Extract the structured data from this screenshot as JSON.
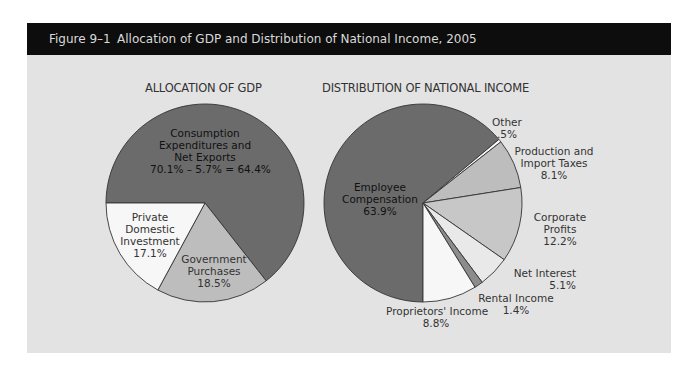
{
  "figure": {
    "number": "Figure 9–1",
    "title": "Allocation of GDP and Distribution of National Income, 2005"
  },
  "colors": {
    "header_bg": "#0d0d0d",
    "header_text": "#d9d9d9",
    "panel_bg": "#e3e3e3",
    "dark_slice": "#6b6b6b",
    "mid_slice": "#bdbdbd",
    "light_slice": "#c7c7c7",
    "pale_slice": "#e9e9e9",
    "white_slice": "#f7f7f7",
    "rental_slice": "#8c8c8c"
  },
  "chart_data": [
    {
      "type": "pie",
      "title": "ALLOCATION OF GDP",
      "categories": [
        "Consumption Expenditures and Net Exports",
        "Government Purchases",
        "Private Domestic Investment"
      ],
      "values": [
        64.4,
        18.5,
        17.1
      ],
      "annotations": [
        "70.1% – 5.7% = 64.4%"
      ],
      "labels": [
        {
          "lines": [
            "Consumption",
            "Expenditures and",
            "Net Exports",
            "70.1% – 5.7% = 64.4%"
          ]
        },
        {
          "lines": [
            "Government",
            "Purchases",
            "18.5%"
          ]
        },
        {
          "lines": [
            "Private",
            "Domestic",
            "Investment",
            "17.1%"
          ]
        }
      ]
    },
    {
      "type": "pie",
      "title": "DISTRIBUTION OF NATIONAL INCOME",
      "categories": [
        "Employee Compensation",
        "Other",
        "Production and Import Taxes",
        "Corporate Profits",
        "Net Interest",
        "Rental Income",
        "Proprietors' Income"
      ],
      "values": [
        63.9,
        0.5,
        8.1,
        12.2,
        5.1,
        1.4,
        8.8
      ],
      "labels": [
        {
          "lines": [
            "Employee",
            "Compensation",
            "63.9%"
          ]
        },
        {
          "lines": [
            "Other",
            ".5%"
          ]
        },
        {
          "lines": [
            "Production and",
            "Import Taxes",
            "8.1%"
          ]
        },
        {
          "lines": [
            "Corporate",
            "Profits",
            "12.2%"
          ]
        },
        {
          "lines": [
            "Net Interest",
            "5.1%"
          ]
        },
        {
          "lines": [
            "Rental Income",
            "1.4%"
          ]
        },
        {
          "lines": [
            "Proprietors' Income",
            "8.8%"
          ]
        }
      ]
    }
  ]
}
